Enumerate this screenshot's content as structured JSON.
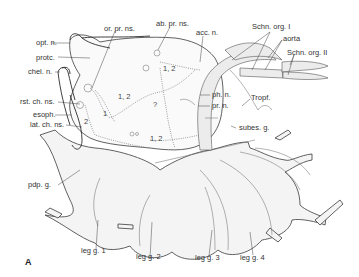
{
  "figure": {
    "panel_letter": "A",
    "labels": {
      "opt_n": "opt. n.",
      "protc": "protc.",
      "chel_n": "chel. n.",
      "or_pr_ns": "or. pr. ns.",
      "ab_pr_ns": "ab. pr. ns.",
      "acc_n": "acc. n.",
      "schn_org_1": "Schn. org. I",
      "aorta": "aorta",
      "schn_org_2": "Schn. org. II",
      "ph_n": "ph. n.",
      "pr_n": "pr. n.",
      "tropf": "Tropf.",
      "rst_ch_ns": "rst. ch. ns.",
      "esoph": "esoph.",
      "lat_ch_ns": "lat. ch. ns.",
      "subes_g": "subes. g.",
      "pdp_g": "pdp. g.",
      "leg_g_1": "leg g. 1",
      "leg_g_2": "leg g. 2",
      "leg_g_3": "leg g. 3",
      "leg_g_4": "leg g. 4"
    },
    "region_numbers": {
      "n1": "1, 2",
      "n2": "1, 2",
      "n3": "?",
      "n4": "1",
      "n5": "2",
      "n6": "1, 2"
    }
  }
}
